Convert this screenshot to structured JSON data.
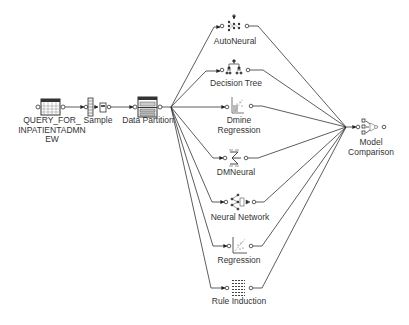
{
  "diagram": {
    "type": "process-flow",
    "edge_color": "#333333",
    "nodes": [
      {
        "id": "query",
        "label_lines": [
          "QUERY_FOR_",
          "INPATIENTADMN",
          "EW"
        ],
        "icon": "data-source-table-icon"
      },
      {
        "id": "sample",
        "label_lines": [
          "Sample"
        ],
        "icon": "sample-icon"
      },
      {
        "id": "partition",
        "label_lines": [
          "Data Partition"
        ],
        "icon": "data-partition-icon"
      },
      {
        "id": "autoneural",
        "label_lines": [
          "AutoNeural"
        ],
        "icon": "autoneural-icon"
      },
      {
        "id": "tree",
        "label_lines": [
          "Decision Tree"
        ],
        "icon": "decision-tree-icon"
      },
      {
        "id": "dmine",
        "label_lines": [
          "Dmine",
          "Regression"
        ],
        "icon": "dmine-regression-icon"
      },
      {
        "id": "dmneural",
        "label_lines": [
          "DMNeural"
        ],
        "icon": "dmneural-icon"
      },
      {
        "id": "neural",
        "label_lines": [
          "Neural Network"
        ],
        "icon": "neural-network-icon"
      },
      {
        "id": "regression",
        "label_lines": [
          "Regression"
        ],
        "icon": "regression-icon"
      },
      {
        "id": "rule",
        "label_lines": [
          "Rule Induction"
        ],
        "icon": "rule-induction-icon"
      },
      {
        "id": "compare",
        "label_lines": [
          "Model",
          "Comparison"
        ],
        "icon": "model-comparison-icon"
      }
    ],
    "edges": [
      [
        "query",
        "sample"
      ],
      [
        "sample",
        "partition"
      ],
      [
        "partition",
        "autoneural"
      ],
      [
        "partition",
        "tree"
      ],
      [
        "partition",
        "dmine"
      ],
      [
        "partition",
        "dmneural"
      ],
      [
        "partition",
        "neural"
      ],
      [
        "partition",
        "regression"
      ],
      [
        "partition",
        "rule"
      ],
      [
        "autoneural",
        "compare"
      ],
      [
        "tree",
        "compare"
      ],
      [
        "dmine",
        "compare"
      ],
      [
        "dmneural",
        "compare"
      ],
      [
        "neural",
        "compare"
      ],
      [
        "regression",
        "compare"
      ],
      [
        "rule",
        "compare"
      ]
    ]
  }
}
